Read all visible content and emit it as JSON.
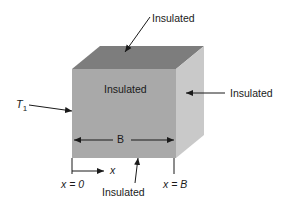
{
  "labels": {
    "top": "Insulated",
    "front": "Insulated",
    "right": "Insulated",
    "bottom": "Insulated",
    "left_temp": "T",
    "left_temp_sub": "1",
    "width": "B",
    "axis": "x",
    "x_start": "x = 0",
    "x_end": "x = B"
  },
  "colors": {
    "front_face": "#a9a9a9",
    "top_face": "#7d7d7d",
    "right_face": "#c9c9c9",
    "lines": "#1a1a1a"
  }
}
